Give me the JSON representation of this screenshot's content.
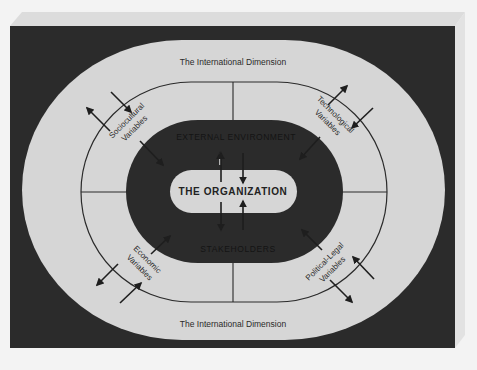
{
  "diagram": {
    "type": "concentric-environment-model",
    "outer_ring": {
      "top_label": "The International Dimension",
      "bottom_label": "The International Dimension"
    },
    "variables": [
      {
        "id": "sociocultural",
        "line1": "Sociocultural",
        "line2": "Variables",
        "position": "top-left"
      },
      {
        "id": "technological",
        "line1": "Technological",
        "line2": "Variables",
        "position": "top-right"
      },
      {
        "id": "economic",
        "line1": "Economic",
        "line2": "Variables",
        "position": "bottom-left"
      },
      {
        "id": "political-legal",
        "line1": "Political-Legal",
        "line2": "Variables",
        "position": "bottom-right"
      }
    ],
    "inner_ring": {
      "top_label": "EXTERNAL ENVIRONMENT",
      "bottom_label": "STAKEHOLDERS"
    },
    "center": {
      "label": "THE ORGANIZATION"
    },
    "colors": {
      "page": "#f3f3f3",
      "slab_face": "#d9d9d9",
      "dark": "#2b2b2b",
      "light": "#d6d6d6",
      "line": "#2a2a2a",
      "text": "#2a2a2a"
    }
  }
}
